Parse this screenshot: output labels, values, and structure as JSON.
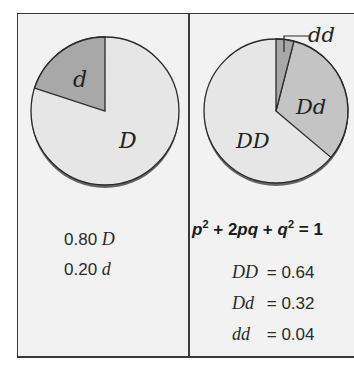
{
  "left_panel": {
    "pie": {
      "slices": [
        {
          "label": "D",
          "value": 0.8,
          "color": "#e6e6e6"
        },
        {
          "label": "d",
          "value": 0.2,
          "color": "#a8a8a8"
        }
      ]
    },
    "allele_frequencies": [
      {
        "value": "0.80",
        "allele": "D"
      },
      {
        "value": "0.20",
        "allele": "d"
      }
    ]
  },
  "right_panel": {
    "pie": {
      "slices": [
        {
          "label": "DD",
          "value": 0.64,
          "color": "#e6e6e6"
        },
        {
          "label": "Dd",
          "value": 0.32,
          "color": "#c4c4c4"
        },
        {
          "label": "dd",
          "value": 0.04,
          "color": "#a8a8a8"
        }
      ]
    },
    "equation": {
      "p": "p",
      "sup1": "2",
      "plus1": " + 2",
      "pq": "pq",
      "plus2": " + ",
      "q": "q",
      "sup2": "2",
      "equals": " = 1"
    },
    "genotype_frequencies": [
      {
        "genotype": "DD",
        "equals": "= 0.64"
      },
      {
        "genotype": "Dd",
        "equals": "= 0.32"
      },
      {
        "genotype": "dd",
        "equals": "= 0.04"
      }
    ]
  },
  "colors": {
    "background": "#f2f2f2",
    "border": "#3a3a3a",
    "light_slice": "#e6e6e6",
    "mid_slice": "#c4c4c4",
    "dark_slice": "#a8a8a8"
  }
}
